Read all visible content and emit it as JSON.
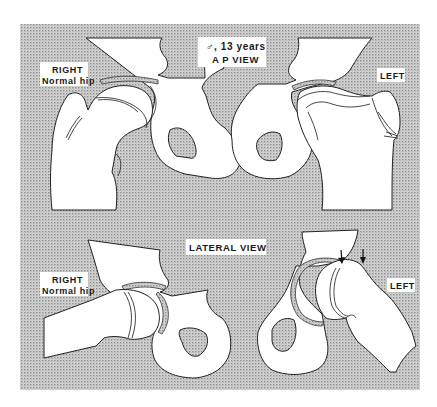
{
  "figure": {
    "type": "medical-illustration",
    "colors": {
      "background_stipple": "#b8b8b8",
      "bone_fill": "#ffffff",
      "outline": "#222222",
      "text": "#1a1a1a"
    }
  },
  "ap_view": {
    "header_line1": "♂, 13 years",
    "header_line2": "A P VIEW",
    "right_label_line1": "RIGHT",
    "right_label_line2": "Normal hip",
    "left_label": "LEFT"
  },
  "lateral_view": {
    "header": "LATERAL VIEW",
    "right_label_line1": "RIGHT",
    "right_label_line2": "Normal hip",
    "left_label": "LEFT",
    "arrows": [
      {
        "name": "slip-arrow-1",
        "direction": "down"
      },
      {
        "name": "slip-arrow-2",
        "direction": "down"
      }
    ]
  }
}
